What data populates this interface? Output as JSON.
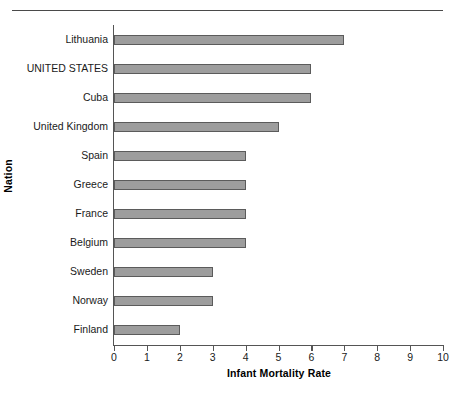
{
  "chart_data": {
    "type": "bar",
    "orientation": "horizontal",
    "title": "",
    "xlabel": "Infant Mortality Rate",
    "ylabel": "Nation",
    "xlim": [
      0,
      10
    ],
    "xticks": [
      "0",
      "1",
      "2",
      "3",
      "4",
      "5",
      "6",
      "7",
      "8",
      "9",
      "10"
    ],
    "grid": false,
    "legend": null,
    "categories": [
      "Lithuania",
      "UNITED STATES",
      "Cuba",
      "United Kingdom",
      "Spain",
      "Greece",
      "France",
      "Belgium",
      "Sweden",
      "Norway",
      "Finland"
    ],
    "values": [
      7,
      6,
      6,
      5,
      4,
      4,
      4,
      4,
      3,
      3,
      2
    ],
    "bar_color": "#9d9d9d",
    "bar_edge_color": "#5b5b5b",
    "axis_color": "#555555",
    "text_color": "#1a1a1a"
  }
}
